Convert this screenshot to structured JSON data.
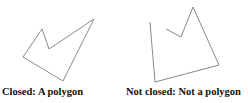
{
  "figures": [
    {
      "id": "closed",
      "caption": "Closed: A polygon",
      "closed": true,
      "points": "42,29 49,49 94,19 63,81 23,57",
      "stroke": "#8a8a8a"
    },
    {
      "id": "open",
      "caption": "Not closed: Not a polygon",
      "closed": false,
      "points": "150,22 155,82 219,65 193,7 181,37 166,29",
      "stroke": "#8a8a8a"
    }
  ]
}
